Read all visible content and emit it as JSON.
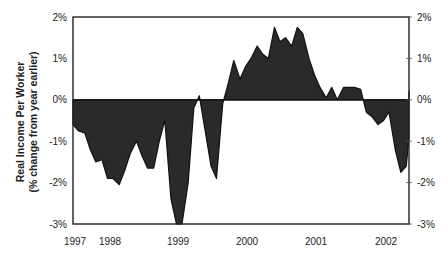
{
  "chart_data": {
    "type": "area",
    "title": "",
    "xlabel": "",
    "ylabel": "Real Income Per Worker",
    "ylabel_sub": "(% change from year earlier)",
    "ylim": [
      -3,
      2
    ],
    "yticks": [
      "2%",
      "1%",
      "0%",
      "-1%",
      "-2%",
      "-3%"
    ],
    "ytick_values": [
      2,
      1,
      0,
      -1,
      -2,
      -3
    ],
    "xticks": [
      "1997",
      "1998",
      "1999",
      "2000",
      "2001",
      "2002"
    ],
    "xtick_values": [
      1997.0,
      1997.5,
      1999.0,
      2000.0,
      2001.0,
      2002.0
    ],
    "grid": false,
    "legend": null,
    "series": [
      {
        "name": "Real Income Per Worker",
        "x": [
          1997.0,
          1997.08,
          1997.17,
          1997.25,
          1997.33,
          1997.42,
          1997.5,
          1997.58,
          1997.67,
          1997.75,
          1997.83,
          1997.92,
          1998.0,
          1998.08,
          1998.17,
          1998.25,
          1998.33,
          1998.42,
          1998.5,
          1998.58,
          1998.67,
          1998.75,
          1998.83,
          1998.92,
          1999.0,
          1999.08,
          1999.17,
          1999.25,
          1999.33,
          1999.42,
          1999.5,
          1999.58,
          1999.67,
          1999.75,
          1999.83,
          1999.92,
          2000.0,
          2000.08,
          2000.17,
          2000.25,
          2000.33,
          2000.42,
          2000.5,
          2000.58,
          2000.67,
          2000.75,
          2000.83,
          2000.92,
          2001.0,
          2001.08,
          2001.17,
          2001.25,
          2001.33,
          2001.42,
          2001.5,
          2001.58,
          2001.67,
          2001.75,
          2001.83,
          2001.92,
          2002.0,
          2002.08,
          2002.17,
          2002.25,
          2002.33
        ],
        "values": [
          -0.6,
          -0.75,
          -0.8,
          -1.2,
          -1.5,
          -1.45,
          -1.9,
          -1.9,
          -2.05,
          -1.7,
          -1.3,
          -1.0,
          -1.35,
          -1.65,
          -1.65,
          -1.0,
          -0.5,
          -2.4,
          -3.0,
          -3.0,
          -2.0,
          -0.2,
          0.1,
          -0.8,
          -1.6,
          -1.9,
          -0.1,
          0.4,
          0.95,
          0.5,
          0.8,
          1.0,
          1.3,
          1.1,
          1.0,
          1.75,
          1.4,
          1.5,
          1.3,
          1.75,
          1.6,
          1.0,
          0.6,
          0.3,
          0.05,
          0.3,
          0.0,
          0.3,
          0.3,
          0.3,
          0.25,
          -0.3,
          -0.4,
          -0.6,
          -0.5,
          -0.3,
          -1.2,
          -1.75,
          -1.6,
          -0.9,
          0.2,
          -0.4,
          -0.4,
          -0.4,
          -0.4
        ]
      }
    ]
  },
  "plot": {
    "fill_color": "#2a2a2a",
    "line_color": "#111111",
    "frame_color": "#222222"
  }
}
